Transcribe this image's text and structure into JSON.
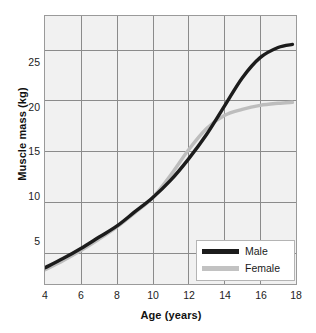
{
  "chart_data": {
    "type": "line",
    "title": "",
    "xlabel": "Age (years)",
    "ylabel": "Muscle mass (kg)",
    "xlim": [
      4,
      18
    ],
    "ylim": [
      1.9,
      28.3
    ],
    "xticks": [
      4,
      6,
      8,
      10,
      12,
      14,
      16,
      18
    ],
    "yticks": [
      5,
      10,
      15,
      20,
      25
    ],
    "grid": true,
    "legend_position": "lower right",
    "series": [
      {
        "name": "Male",
        "color": "#1c1c1c",
        "x": [
          4,
          5,
          6,
          7,
          8,
          9,
          10,
          11,
          12,
          13,
          14,
          15,
          16,
          17,
          17.8
        ],
        "values": [
          3.5,
          4.4,
          5.4,
          6.5,
          7.6,
          9.0,
          10.4,
          12.1,
          14.2,
          16.6,
          19.4,
          22.2,
          24.2,
          25.2,
          25.5
        ]
      },
      {
        "name": "Female",
        "color": "#bdbdbd",
        "x": [
          4,
          5,
          6,
          7,
          8,
          9,
          10,
          11,
          12,
          13,
          14,
          15,
          16,
          17,
          17.8
        ],
        "values": [
          3.3,
          4.2,
          5.2,
          6.3,
          7.5,
          8.9,
          10.4,
          12.6,
          15.1,
          17.2,
          18.5,
          19.1,
          19.5,
          19.7,
          19.8
        ]
      }
    ]
  },
  "legend": {
    "entries": [
      {
        "label": "Male"
      },
      {
        "label": "Female"
      }
    ]
  },
  "axes": {
    "y_title": "Muscle mass (kg)",
    "x_title": "Age (years)",
    "y_tick_labels": [
      "25",
      "20",
      "15",
      "10",
      "5"
    ],
    "x_tick_labels": [
      "4",
      "6",
      "8",
      "10",
      "12",
      "14",
      "16",
      "18"
    ]
  }
}
